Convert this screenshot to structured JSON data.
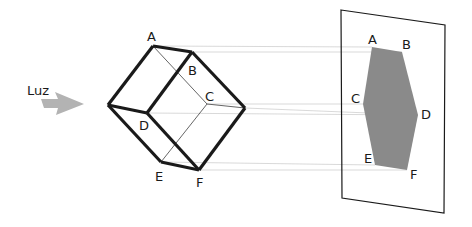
{
  "diagram": {
    "light_label": "Luz",
    "cube_labels": {
      "A": "A",
      "B": "B",
      "C": "C",
      "D": "D",
      "E": "E",
      "F": "F"
    },
    "shadow_labels": {
      "A": "A",
      "B": "B",
      "C": "C",
      "D": "D",
      "E": "E",
      "F": "F"
    },
    "colors": {
      "edges": "#1a1a1a",
      "projection_lines": "#c8c8c8",
      "shadow_fill": "#8a8a8a",
      "arrow": "#b0b0b0"
    }
  }
}
